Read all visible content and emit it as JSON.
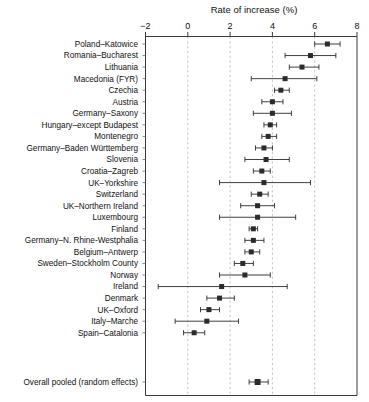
{
  "chart_data": {
    "type": "scatter",
    "subtype": "forest-plot",
    "title": "",
    "xlabel": "Rate of increase (%)",
    "ylabel": "",
    "xlim": [
      -2,
      8
    ],
    "xticks": [
      -2,
      0,
      2,
      4,
      6,
      8
    ],
    "xtick_labels": [
      "−2",
      "0",
      "2",
      "4",
      "6",
      "8"
    ],
    "grid": "vertical dashed gridlines at 0, 2, 4, 6",
    "legend": "none",
    "marker_style": "filled square with horizontal 95% confidence interval whiskers",
    "categories": [
      "Poland–Katowice",
      "Romania–Bucharest",
      "Lithuania",
      "Macedonia (FYR)",
      "Czechia",
      "Austria",
      "Germany–Saxony",
      "Hungary–except Budapest",
      "Montenegro",
      "Germany–Baden Württemberg",
      "Slovenia",
      "Croatia–Zagreb",
      "UK–Yorkshire",
      "Switzerland",
      "UK–Northern Ireland",
      "Luxembourg",
      "Finland",
      "Germany–N. Rhine-Westphalia",
      "Belgium–Antwerp",
      "Sweden–Stockholm County",
      "Norway",
      "Ireland",
      "Denmark",
      "UK–Oxford",
      "Italy–Marche",
      "Spain–Catalonia"
    ],
    "studies": [
      {
        "label": "Poland–Katowice",
        "estimate": 6.6,
        "ci_low": 6.0,
        "ci_high": 7.2
      },
      {
        "label": "Romania–Bucharest",
        "estimate": 5.8,
        "ci_low": 4.6,
        "ci_high": 7.0
      },
      {
        "label": "Lithuania",
        "estimate": 5.4,
        "ci_low": 4.8,
        "ci_high": 6.2
      },
      {
        "label": "Macedonia (FYR)",
        "estimate": 4.6,
        "ci_low": 3.0,
        "ci_high": 6.1
      },
      {
        "label": "Czechia",
        "estimate": 4.4,
        "ci_low": 4.1,
        "ci_high": 4.8
      },
      {
        "label": "Austria",
        "estimate": 4.0,
        "ci_low": 3.5,
        "ci_high": 4.5
      },
      {
        "label": "Germany–Saxony",
        "estimate": 4.0,
        "ci_low": 3.1,
        "ci_high": 4.9
      },
      {
        "label": "Hungary–except Budapest",
        "estimate": 3.9,
        "ci_low": 3.6,
        "ci_high": 4.2
      },
      {
        "label": "Montenegro",
        "estimate": 3.8,
        "ci_low": 3.5,
        "ci_high": 4.2
      },
      {
        "label": "Germany–Baden Württemberg",
        "estimate": 3.6,
        "ci_low": 3.2,
        "ci_high": 4.0
      },
      {
        "label": "Slovenia",
        "estimate": 3.7,
        "ci_low": 2.7,
        "ci_high": 4.8
      },
      {
        "label": "Croatia–Zagreb",
        "estimate": 3.5,
        "ci_low": 3.1,
        "ci_high": 3.9
      },
      {
        "label": "UK–Yorkshire",
        "estimate": 3.6,
        "ci_low": 1.5,
        "ci_high": 5.8
      },
      {
        "label": "Switzerland",
        "estimate": 3.4,
        "ci_low": 3.0,
        "ci_high": 3.8
      },
      {
        "label": "UK–Northern Ireland",
        "estimate": 3.3,
        "ci_low": 2.5,
        "ci_high": 4.1
      },
      {
        "label": "Luxembourg",
        "estimate": 3.3,
        "ci_low": 1.5,
        "ci_high": 5.1
      },
      {
        "label": "Finland",
        "estimate": 3.1,
        "ci_low": 2.9,
        "ci_high": 3.3
      },
      {
        "label": "Germany–N. Rhine-Westphalia",
        "estimate": 3.1,
        "ci_low": 2.7,
        "ci_high": 3.6
      },
      {
        "label": "Belgium–Antwerp",
        "estimate": 3.0,
        "ci_low": 2.7,
        "ci_high": 3.4
      },
      {
        "label": "Sweden–Stockholm County",
        "estimate": 2.6,
        "ci_low": 2.2,
        "ci_high": 3.1
      },
      {
        "label": "Norway",
        "estimate": 2.7,
        "ci_low": 1.5,
        "ci_high": 3.9
      },
      {
        "label": "Ireland",
        "estimate": 1.6,
        "ci_low": -1.4,
        "ci_high": 4.7
      },
      {
        "label": "Denmark",
        "estimate": 1.5,
        "ci_low": 0.9,
        "ci_high": 2.2
      },
      {
        "label": "UK–Oxford",
        "estimate": 1.0,
        "ci_low": 0.6,
        "ci_high": 1.5
      },
      {
        "label": "Italy–Marche",
        "estimate": 0.9,
        "ci_low": -0.6,
        "ci_high": 2.4
      },
      {
        "label": "Spain–Catalonia",
        "estimate": 0.3,
        "ci_low": -0.2,
        "ci_high": 0.8
      }
    ],
    "pooled": {
      "label": "Overall pooled (random effects)",
      "estimate": 3.3,
      "ci_low": 2.9,
      "ci_high": 3.8
    },
    "values": [
      6.6,
      5.8,
      5.4,
      4.6,
      4.4,
      4.0,
      4.0,
      3.9,
      3.8,
      3.6,
      3.7,
      3.5,
      3.6,
      3.4,
      3.3,
      3.3,
      3.1,
      3.1,
      3.0,
      2.6,
      2.7,
      1.6,
      1.5,
      1.0,
      0.9,
      0.3
    ]
  },
  "axis": {
    "x_title": "Rate of increase (%)",
    "ticks": [
      "−2",
      "0",
      "2",
      "4",
      "6",
      "8"
    ]
  },
  "colors": {
    "marker": "#2b2b2b",
    "ci": "#2b2b2b",
    "grid": "#b8b8b8",
    "axis": "#3a3a3a",
    "background": "#ffffff"
  }
}
